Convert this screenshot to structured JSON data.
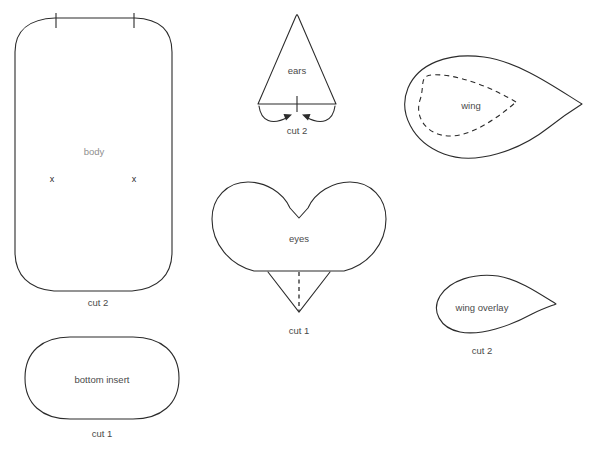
{
  "document": {
    "type": "sewing-pattern-template",
    "background_color": "#ffffff",
    "line_color": "#2b2b2b",
    "label_color": "#4a4a4a",
    "width": 592,
    "height": 449,
    "header_ghost_text": ""
  },
  "pieces": {
    "body": {
      "label": "body",
      "cut_label": "cut 2",
      "marks": [
        "x",
        "x"
      ],
      "notches": 2
    },
    "ears": {
      "label": "ears",
      "cut_label": "cut 2",
      "notches": 1,
      "arrows": 2
    },
    "wing": {
      "label": "wing",
      "cut_label": ""
    },
    "eyes": {
      "label": "eyes",
      "cut_label": "cut 1",
      "dart": "v-dart-with-fold-line"
    },
    "wing_overlay": {
      "label": "wing overlay",
      "cut_label": "cut 2"
    },
    "bottom_insert": {
      "label": "bottom insert",
      "cut_label": "cut 1"
    }
  }
}
